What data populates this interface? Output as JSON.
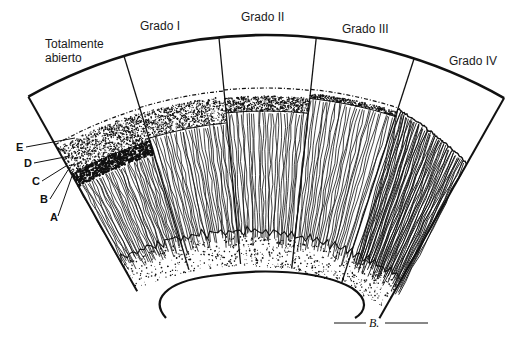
{
  "figure": {
    "type": "anatomical-diagram",
    "background": "#ffffff",
    "ink_color": "#111111"
  },
  "grades": [
    {
      "id": "open",
      "label_line1": "Totalmente",
      "label_line2": "abierto"
    },
    {
      "id": "grado-1",
      "label_line1": "Grado I"
    },
    {
      "id": "grado-2",
      "label_line1": "Grado II"
    },
    {
      "id": "grado-3",
      "label_line1": "Grado III"
    },
    {
      "id": "grado-4",
      "label_line1": "Grado IV"
    }
  ],
  "layer_labels": [
    "E",
    "D",
    "C",
    "B",
    "A"
  ],
  "signature": "B."
}
